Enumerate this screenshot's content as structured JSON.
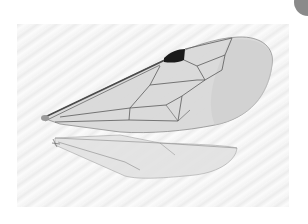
{
  "image": {
    "subject": "insect wing (forewing and hindwing)",
    "background_color": "#f3f3f3",
    "membrane_color": "#d6d6d6",
    "vein_color": "#5a5a5a",
    "stigma_color": "#1a1a1a",
    "corner_circle_color": "#8a8a8a"
  }
}
